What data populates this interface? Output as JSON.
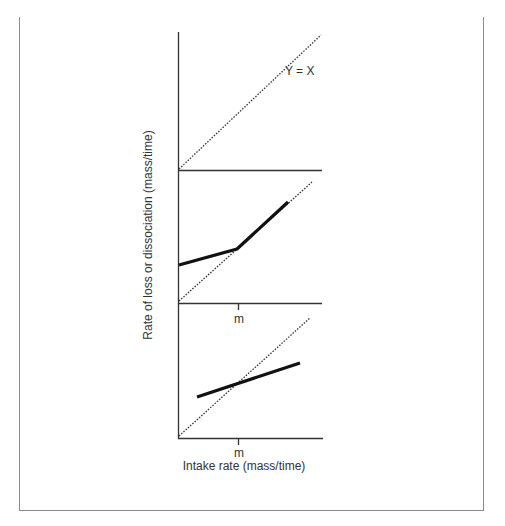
{
  "figure": {
    "y_axis_label": "Rate of loss or dissociation (mass/time)",
    "x_axis_label": "Intake rate (mass/time)",
    "reference_line_label": "Y = X",
    "tick_label": "m",
    "colors": {
      "axis": "#333333",
      "frame": "#8a8a8a",
      "solid_line": "#111111",
      "dotted_line": "#333333"
    },
    "panels": [
      {
        "name": "top",
        "description": "Reference line Y = X only"
      },
      {
        "name": "middle",
        "description": "Piecewise linear: shallow slope below m, steeper slope above m, meeting Y = X at m"
      },
      {
        "name": "bottom",
        "description": "Single line with slope less than 1 crossing Y = X at m"
      }
    ]
  }
}
